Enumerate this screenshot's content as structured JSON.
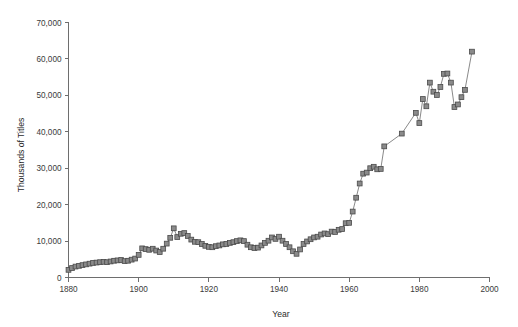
{
  "chart_data": {
    "type": "line",
    "title": "",
    "xlabel": "Year",
    "ylabel": "Thousands of Titles",
    "xlim": [
      1880,
      2000
    ],
    "ylim": [
      0,
      70000
    ],
    "grid": false,
    "legend": "none",
    "marker": "square",
    "x_ticks": [
      1880,
      1900,
      1920,
      1940,
      1960,
      1980,
      2000
    ],
    "x_tick_labels": [
      "1880",
      "1900",
      "1920",
      "1940",
      "1960",
      "1980",
      "2000"
    ],
    "y_ticks": [
      0,
      10000,
      20000,
      30000,
      40000,
      50000,
      60000,
      70000
    ],
    "y_tick_labels": [
      "0",
      "10,000",
      "20,000",
      "30,000",
      "40,000",
      "50,000",
      "60,000",
      "70,000"
    ],
    "series": [
      {
        "name": "Titles published",
        "color": "#8a8a8a",
        "x": [
          1880,
          1881,
          1882,
          1883,
          1884,
          1885,
          1886,
          1887,
          1888,
          1889,
          1890,
          1891,
          1892,
          1893,
          1894,
          1895,
          1896,
          1897,
          1898,
          1899,
          1900,
          1901,
          1902,
          1903,
          1904,
          1905,
          1906,
          1907,
          1908,
          1909,
          1910,
          1911,
          1912,
          1913,
          1914,
          1915,
          1916,
          1917,
          1918,
          1919,
          1920,
          1921,
          1922,
          1923,
          1924,
          1925,
          1926,
          1927,
          1928,
          1929,
          1930,
          1931,
          1932,
          1933,
          1934,
          1935,
          1936,
          1937,
          1938,
          1939,
          1940,
          1941,
          1942,
          1943,
          1944,
          1945,
          1946,
          1947,
          1948,
          1949,
          1950,
          1951,
          1952,
          1953,
          1954,
          1955,
          1956,
          1957,
          1958,
          1959,
          1960,
          1961,
          1962,
          1963,
          1964,
          1965,
          1966,
          1967,
          1968,
          1969,
          1970,
          1975,
          1979,
          1980,
          1981,
          1982,
          1983,
          1984,
          1985,
          1986,
          1987,
          1988,
          1989,
          1990,
          1991,
          1992,
          1993,
          1995
        ],
        "y": [
          2100,
          2600,
          3000,
          3200,
          3400,
          3600,
          3800,
          4000,
          4100,
          4200,
          4300,
          4200,
          4400,
          4600,
          4700,
          4800,
          4500,
          4600,
          4900,
          5200,
          6200,
          8000,
          7800,
          7600,
          7900,
          7400,
          7000,
          7900,
          9300,
          10900,
          13500,
          11100,
          12000,
          12200,
          11400,
          10400,
          9800,
          9700,
          9200,
          8700,
          8400,
          8300,
          8600,
          8800,
          9100,
          9200,
          9500,
          9700,
          10000,
          10200,
          10000,
          9000,
          8300,
          8100,
          8200,
          8800,
          9500,
          10100,
          11000,
          10600,
          11200,
          10100,
          9200,
          8300,
          7200,
          6500,
          7700,
          9200,
          9900,
          10500,
          11000,
          11200,
          11800,
          12100,
          11900,
          12600,
          12500,
          13100,
          13300,
          14900,
          15000,
          18100,
          21900,
          25800,
          28500,
          28800,
          30000,
          30400,
          29700,
          29800,
          36000,
          39500,
          45200,
          42400,
          49000,
          47000,
          53500,
          51000,
          50100,
          52300,
          55900,
          56000,
          53500,
          46800,
          47500,
          49500,
          51500,
          62000
        ]
      }
    ]
  },
  "axes": {
    "y_axis_title": "Thousands of Titles",
    "x_axis_title": "Year"
  }
}
